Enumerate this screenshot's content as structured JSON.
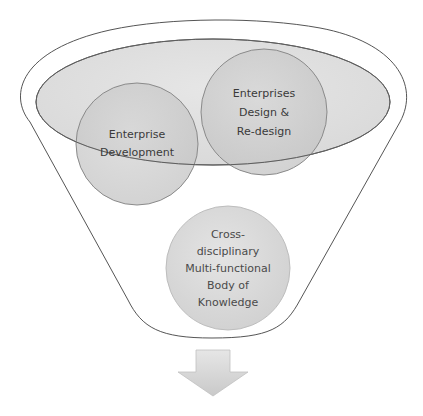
{
  "diagram": {
    "type": "funnel-venn",
    "colors": {
      "background": "#ffffff",
      "funnel_stroke": "#555555",
      "funnel_fill": "#ffffff",
      "ellipse_fill": "#d9d9d9",
      "circle_fill": "#cccccc",
      "circle_stroke": "#8a8a8a",
      "text": "#3a3a3a",
      "arrow_fill": "#d6d6d6"
    },
    "circles": [
      {
        "id": "enterprise-development",
        "lines": [
          "Enterprise",
          "Development"
        ]
      },
      {
        "id": "enterprises-design-redesign",
        "lines": [
          "Enterprises",
          "Design &",
          "Re-design"
        ]
      },
      {
        "id": "body-of-knowledge",
        "lines": [
          "Cross-",
          "disciplinary",
          "Multi-functional",
          "Body of",
          "Knowledge"
        ]
      }
    ],
    "output_arrow": "down-arrow"
  }
}
